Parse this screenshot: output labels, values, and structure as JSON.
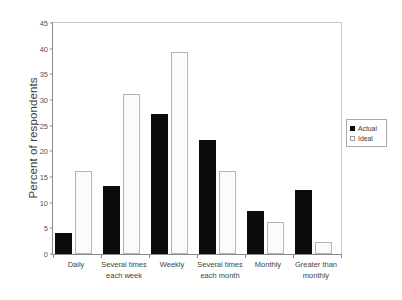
{
  "chart_data": {
    "type": "bar",
    "title": "",
    "xlabel": "",
    "ylabel": "Percent of respondents",
    "ylim": [
      0,
      45
    ],
    "ytick_step": 5,
    "yticks": [
      "0",
      "5",
      "10",
      "15",
      "20",
      "25",
      "30",
      "35",
      "40",
      "45"
    ],
    "grid": false,
    "legend_position": "right-outside",
    "categories": [
      "Daily",
      "Several times each week",
      "Weekly",
      "Several times each month",
      "Monthly",
      "Greater than monthly"
    ],
    "category_lines": [
      [
        "Daily"
      ],
      [
        "Several times",
        "each week"
      ],
      [
        "Weekly"
      ],
      [
        "Several times",
        "each month"
      ],
      [
        "Monthly"
      ],
      [
        "Greater than",
        "monthly"
      ]
    ],
    "series": [
      {
        "name": "Actual",
        "color": "#0b0b0b",
        "values": [
          4.1,
          13.2,
          27.3,
          22.2,
          8.4,
          12.5
        ]
      },
      {
        "name": "Ideal",
        "color": "#ffffff",
        "values": [
          16.2,
          31.2,
          39.4,
          16.2,
          6.3,
          2.4
        ]
      }
    ]
  },
  "legend": {
    "items": [
      {
        "label": "Actual",
        "swatch": "filled-square-icon"
      },
      {
        "label": "Ideal",
        "swatch": "open-square-icon"
      }
    ]
  },
  "axes": {
    "y_title": "Percent of respondents"
  }
}
